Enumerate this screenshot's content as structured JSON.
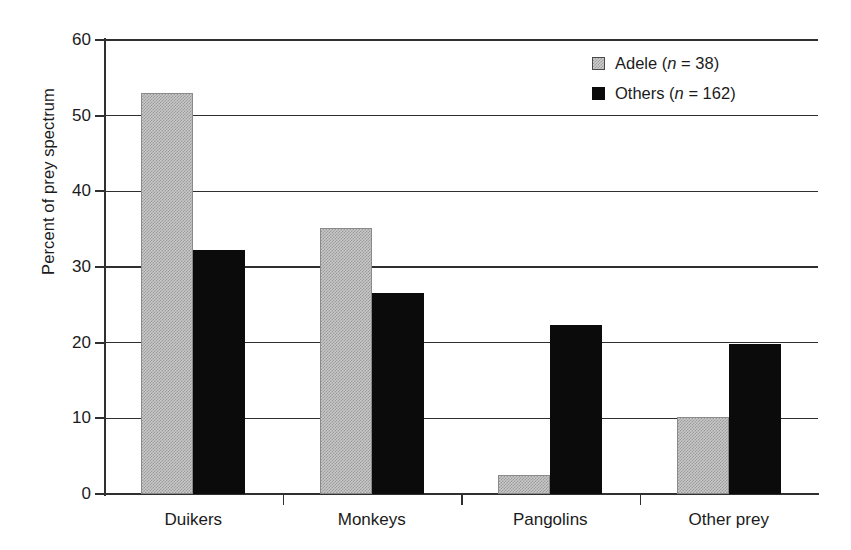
{
  "chart_data": {
    "type": "bar",
    "title": "",
    "xlabel": "",
    "ylabel": "Percent of prey spectrum",
    "categories": [
      "Duikers",
      "Monkeys",
      "Pangolins",
      "Other prey"
    ],
    "series": [
      {
        "name": "Adele",
        "n": 38,
        "legend_label": "Adele (n = 38)",
        "color": "#c8c8c8",
        "values": [
          53.0,
          35.2,
          2.5,
          10.2
        ]
      },
      {
        "name": "Others",
        "n": 162,
        "legend_label": "Others (n = 162)",
        "color": "#0b0b0b",
        "values": [
          32.2,
          26.6,
          22.3,
          19.8
        ]
      }
    ],
    "ylim": [
      0,
      60
    ],
    "yticks": [
      0,
      10,
      20,
      30,
      40,
      50,
      60
    ],
    "ytick_labels": [
      "0",
      "10",
      "20",
      "30",
      "40",
      "50",
      "60"
    ],
    "grid": true,
    "legend_position": "top-right"
  },
  "legend": {
    "entries": [
      {
        "name_text": "Adele (",
        "italic_n": "n",
        "value_text": " = 38)"
      },
      {
        "name_text": "Others (",
        "italic_n": "n",
        "value_text": " = 162)"
      }
    ]
  }
}
